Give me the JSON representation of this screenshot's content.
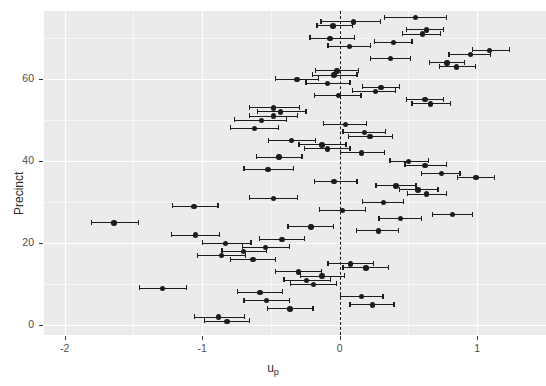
{
  "chart_data": {
    "type": "scatter",
    "title": "",
    "subtitle": "",
    "xlabel": "u_p",
    "xlabel_base": "u",
    "xlabel_sub": "p",
    "ylabel": "Precinct",
    "xlim": [
      -2.15,
      1.5
    ],
    "ylim": [
      -2.5,
      76.5
    ],
    "xticks": [
      -2,
      -1,
      0,
      1
    ],
    "xtick_labels": [
      "-2",
      "-1",
      "0",
      "1"
    ],
    "yticks": [
      0,
      20,
      40,
      60
    ],
    "ytick_labels": [
      "0",
      "20",
      "40",
      "60"
    ],
    "grid": "major-white-on-grey",
    "legend": "none",
    "reference_line": {
      "x": 0,
      "style": "dashed",
      "color": "#1a1a1a"
    },
    "marker": "filled-circle",
    "error_bars": "horizontal-with-caps",
    "series_name": "precinct random effect estimate",
    "points": [
      {
        "precinct": 75,
        "x": 0.55,
        "lo": 0.32,
        "hi": 0.78
      },
      {
        "precinct": 74,
        "x": 0.1,
        "lo": -0.14,
        "hi": 0.3
      },
      {
        "precinct": 73,
        "x": -0.05,
        "lo": -0.17,
        "hi": 0.1
      },
      {
        "precinct": 72,
        "x": 0.63,
        "lo": 0.48,
        "hi": 0.76
      },
      {
        "precinct": 71,
        "x": 0.6,
        "lo": 0.45,
        "hi": 0.74
      },
      {
        "precinct": 70,
        "x": -0.07,
        "lo": -0.22,
        "hi": 0.11
      },
      {
        "precinct": 69,
        "x": 0.39,
        "lo": 0.25,
        "hi": 0.53
      },
      {
        "precinct": 68,
        "x": 0.07,
        "lo": -0.09,
        "hi": 0.23
      },
      {
        "precinct": 67,
        "x": 1.09,
        "lo": 0.96,
        "hi": 1.24
      },
      {
        "precinct": 66,
        "x": 0.95,
        "lo": 0.79,
        "hi": 1.1
      },
      {
        "precinct": 65,
        "x": 0.37,
        "lo": 0.22,
        "hi": 0.52
      },
      {
        "precinct": 64,
        "x": 0.78,
        "lo": 0.65,
        "hi": 0.91
      },
      {
        "precinct": 63,
        "x": 0.85,
        "lo": 0.72,
        "hi": 0.99
      },
      {
        "precinct": 62,
        "x": -0.02,
        "lo": -0.18,
        "hi": 0.14
      },
      {
        "precinct": 61,
        "x": -0.04,
        "lo": -0.2,
        "hi": 0.13
      },
      {
        "precinct": 60,
        "x": -0.31,
        "lo": -0.47,
        "hi": -0.15
      },
      {
        "precinct": 59,
        "x": -0.09,
        "lo": -0.25,
        "hi": 0.08
      },
      {
        "precinct": 58,
        "x": 0.3,
        "lo": 0.16,
        "hi": 0.44
      },
      {
        "precinct": 57,
        "x": 0.26,
        "lo": 0.09,
        "hi": 0.41
      },
      {
        "precinct": 56,
        "x": -0.01,
        "lo": -0.19,
        "hi": 0.16
      },
      {
        "precinct": 55,
        "x": 0.62,
        "lo": 0.48,
        "hi": 0.76
      },
      {
        "precinct": 54,
        "x": 0.66,
        "lo": 0.52,
        "hi": 0.81
      },
      {
        "precinct": 53,
        "x": -0.48,
        "lo": -0.66,
        "hi": -0.29
      },
      {
        "precinct": 52,
        "x": -0.43,
        "lo": -0.6,
        "hi": -0.24
      },
      {
        "precinct": 51,
        "x": -0.48,
        "lo": -0.66,
        "hi": -0.3
      },
      {
        "precinct": 50,
        "x": -0.57,
        "lo": -0.77,
        "hi": -0.38
      },
      {
        "precinct": 49,
        "x": 0.04,
        "lo": -0.12,
        "hi": 0.2
      },
      {
        "precinct": 48,
        "x": -0.62,
        "lo": -0.8,
        "hi": -0.44
      },
      {
        "precinct": 47,
        "x": 0.18,
        "lo": 0.02,
        "hi": 0.34
      },
      {
        "precinct": 46,
        "x": 0.22,
        "lo": 0.06,
        "hi": 0.39
      },
      {
        "precinct": 45,
        "x": -0.35,
        "lo": -0.52,
        "hi": -0.17
      },
      {
        "precinct": 44,
        "x": -0.13,
        "lo": -0.3,
        "hi": 0.05
      },
      {
        "precinct": 43,
        "x": -0.09,
        "lo": -0.26,
        "hi": 0.08
      },
      {
        "precinct": 42,
        "x": 0.16,
        "lo": 0.0,
        "hi": 0.33
      },
      {
        "precinct": 41,
        "x": -0.44,
        "lo": -0.61,
        "hi": -0.27
      },
      {
        "precinct": 40,
        "x": 0.5,
        "lo": 0.36,
        "hi": 0.65
      },
      {
        "precinct": 39,
        "x": 0.62,
        "lo": 0.47,
        "hi": 0.78
      },
      {
        "precinct": 38,
        "x": -0.52,
        "lo": -0.7,
        "hi": -0.33
      },
      {
        "precinct": 37,
        "x": 0.74,
        "lo": 0.59,
        "hi": 0.88
      },
      {
        "precinct": 36,
        "x": 0.99,
        "lo": 0.85,
        "hi": 1.13
      },
      {
        "precinct": 35,
        "x": -0.04,
        "lo": -0.19,
        "hi": 0.13
      },
      {
        "precinct": 34,
        "x": 0.41,
        "lo": 0.26,
        "hi": 0.56
      },
      {
        "precinct": 33,
        "x": 0.57,
        "lo": 0.43,
        "hi": 0.72
      },
      {
        "precinct": 32,
        "x": 0.63,
        "lo": 0.49,
        "hi": 0.78
      },
      {
        "precinct": 31,
        "x": -0.48,
        "lo": -0.66,
        "hi": -0.3
      },
      {
        "precinct": 30,
        "x": 0.32,
        "lo": 0.16,
        "hi": 0.47
      },
      {
        "precinct": 29,
        "x": -1.06,
        "lo": -1.22,
        "hi": -0.88
      },
      {
        "precinct": 28,
        "x": 0.02,
        "lo": -0.15,
        "hi": 0.19
      },
      {
        "precinct": 27,
        "x": 0.82,
        "lo": 0.67,
        "hi": 0.97
      },
      {
        "precinct": 26,
        "x": 0.44,
        "lo": 0.28,
        "hi": 0.6
      },
      {
        "precinct": 25,
        "x": -1.64,
        "lo": -1.81,
        "hi": -1.46
      },
      {
        "precinct": 24,
        "x": -0.21,
        "lo": -0.38,
        "hi": -0.04
      },
      {
        "precinct": 23,
        "x": 0.28,
        "lo": 0.12,
        "hi": 0.43
      },
      {
        "precinct": 22,
        "x": -1.05,
        "lo": -1.23,
        "hi": -0.87
      },
      {
        "precinct": 21,
        "x": -0.42,
        "lo": -0.59,
        "hi": -0.25
      },
      {
        "precinct": 20,
        "x": -0.83,
        "lo": -1.0,
        "hi": -0.64
      },
      {
        "precinct": 19,
        "x": -0.54,
        "lo": -0.71,
        "hi": -0.36
      },
      {
        "precinct": 18,
        "x": -0.7,
        "lo": -0.86,
        "hi": -0.53
      },
      {
        "precinct": 17,
        "x": -0.86,
        "lo": -1.04,
        "hi": -0.68
      },
      {
        "precinct": 16,
        "x": -0.63,
        "lo": -0.8,
        "hi": -0.46
      },
      {
        "precinct": 15,
        "x": 0.08,
        "lo": -0.09,
        "hi": 0.25
      },
      {
        "precinct": 14,
        "x": 0.19,
        "lo": 0.02,
        "hi": 0.36
      },
      {
        "precinct": 13,
        "x": -0.3,
        "lo": -0.47,
        "hi": -0.13
      },
      {
        "precinct": 12,
        "x": -0.13,
        "lo": -0.29,
        "hi": 0.04
      },
      {
        "precinct": 11,
        "x": -0.24,
        "lo": -0.41,
        "hi": -0.06
      },
      {
        "precinct": 10,
        "x": -0.19,
        "lo": -0.36,
        "hi": -0.02
      },
      {
        "precinct": 9,
        "x": -1.29,
        "lo": -1.46,
        "hi": -1.11
      },
      {
        "precinct": 8,
        "x": -0.58,
        "lo": -0.75,
        "hi": -0.41
      },
      {
        "precinct": 7,
        "x": 0.16,
        "lo": 0.0,
        "hi": 0.32
      },
      {
        "precinct": 6,
        "x": -0.53,
        "lo": -0.7,
        "hi": -0.36
      },
      {
        "precinct": 5,
        "x": 0.24,
        "lo": 0.07,
        "hi": 0.4
      },
      {
        "precinct": 4,
        "x": -0.36,
        "lo": -0.53,
        "hi": -0.19
      },
      {
        "precinct": 2,
        "x": -0.88,
        "lo": -1.06,
        "hi": -0.69
      },
      {
        "precinct": 1,
        "x": -0.82,
        "lo": -0.99,
        "hi": -0.65
      }
    ]
  }
}
